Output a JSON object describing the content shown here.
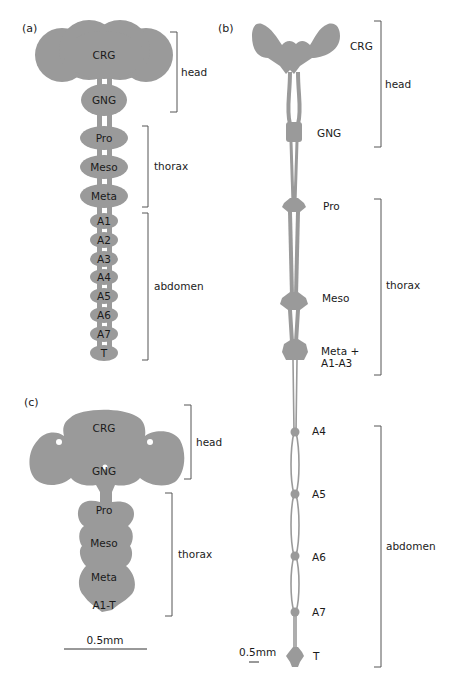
{
  "figure": {
    "fill_color": "#9a9a9a",
    "text_color": "#1a1a1a",
    "bracket_color": "#555555"
  },
  "panel_a": {
    "label": "(a)",
    "ganglia": [
      "CRG",
      "GNG",
      "Pro",
      "Meso",
      "Meta",
      "A1",
      "A2",
      "A3",
      "A4",
      "A5",
      "A6",
      "A7",
      "T"
    ],
    "regions": {
      "head": "head",
      "thorax": "thorax",
      "abdomen": "abdomen"
    }
  },
  "panel_b": {
    "label": "(b)",
    "ganglia": {
      "crg": "CRG",
      "gng": "GNG",
      "pro": "Pro",
      "meso": "Meso",
      "meta_line1": "Meta +",
      "meta_line2": "A1-A3",
      "a4": "A4",
      "a5": "A5",
      "a6": "A6",
      "a7": "A7",
      "t": "T"
    },
    "regions": {
      "head": "head",
      "thorax": "thorax",
      "abdomen": "abdomen"
    },
    "scale_bar": "0.5mm"
  },
  "panel_c": {
    "label": "(c)",
    "ganglia": {
      "crg": "CRG",
      "gng": "GNG",
      "pro": "Pro",
      "meso": "Meso",
      "meta": "Meta",
      "a1t": "A1-T"
    },
    "regions": {
      "head": "head",
      "thorax": "thorax"
    },
    "scale_bar": "0.5mm"
  }
}
